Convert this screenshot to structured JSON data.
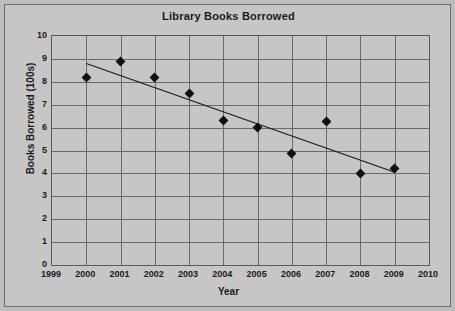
{
  "chart_data": {
    "type": "scatter",
    "title": "Library Books Borrowed",
    "xlabel": "Year",
    "ylabel": "Books Borrowed  (100s)",
    "xlim": [
      1999,
      2010
    ],
    "ylim": [
      0,
      10
    ],
    "grid": true,
    "legend": "none",
    "x_ticks": [
      "1999",
      "2000",
      "2001",
      "2002",
      "2003",
      "2004",
      "2005",
      "2006",
      "2007",
      "2008",
      "2009",
      "2010"
    ],
    "y_ticks": [
      "0",
      "1",
      "2",
      "3",
      "4",
      "5",
      "6",
      "7",
      "8",
      "9",
      "10"
    ],
    "x": [
      2000,
      2001,
      2002,
      2003,
      2004,
      2005,
      2006,
      2007,
      2008,
      2009
    ],
    "values": [
      8.2,
      8.9,
      8.2,
      7.5,
      6.3,
      6.0,
      4.85,
      6.25,
      4.0,
      4.2
    ],
    "points": [
      {
        "year": 2000,
        "value": 8.2
      },
      {
        "year": 2001,
        "value": 8.9
      },
      {
        "year": 2002,
        "value": 8.2
      },
      {
        "year": 2003,
        "value": 7.5
      },
      {
        "year": 2004,
        "value": 6.3
      },
      {
        "year": 2005,
        "value": 6.0
      },
      {
        "year": 2006,
        "value": 4.85
      },
      {
        "year": 2007,
        "value": 6.25
      },
      {
        "year": 2008,
        "value": 4.0
      },
      {
        "year": 2009,
        "value": 4.2
      }
    ],
    "trendline": {
      "x_start": 2000,
      "y_start": 8.8,
      "x_end": 2009,
      "y_end": 4.05,
      "color": "#1a1a1a"
    },
    "marker": {
      "shape": "diamond",
      "color": "#101010"
    },
    "colors": {
      "background": "#bdbdbd",
      "plot_background": "#c6c6c6",
      "gridline": "#6a6a6a",
      "axis": "#5a5a5a",
      "text": "#1a1a1a"
    }
  }
}
